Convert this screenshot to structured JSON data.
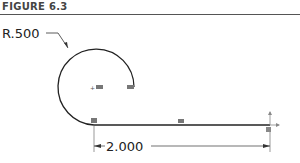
{
  "figure": {
    "title": "FIGURE 6.3"
  },
  "drawing": {
    "radius_label": "R.500",
    "length_label": "2.000",
    "line_color": "#222222"
  }
}
